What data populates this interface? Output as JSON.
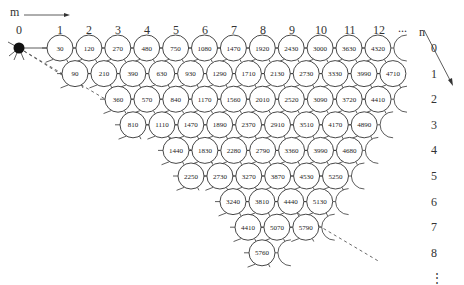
{
  "axes": {
    "m_label": "m",
    "n_label": "n",
    "column_labels": [
      "0",
      "1",
      "2",
      "3",
      "4",
      "5",
      "6",
      "7",
      "8",
      "9",
      "10",
      "11",
      "12",
      "..."
    ],
    "row_labels": [
      "0",
      "1",
      "2",
      "3",
      "4",
      "5",
      "6",
      "7",
      "8",
      "⋮"
    ]
  },
  "start_node": {
    "label": "0",
    "fill": "#111111"
  },
  "rows": [
    {
      "n": 0,
      "start_col": 1,
      "values": [
        30,
        120,
        270,
        480,
        750,
        1080,
        1470,
        1920,
        2430,
        3000,
        3630,
        4320
      ]
    },
    {
      "n": 1,
      "start_col": 1,
      "values": [
        90,
        210,
        390,
        630,
        930,
        1290,
        1710,
        2130,
        2730,
        3330,
        3990,
        4710
      ]
    },
    {
      "n": 2,
      "start_col": 3,
      "values": [
        360,
        570,
        840,
        1170,
        1560,
        2010,
        2520,
        3090,
        3720,
        4410
      ]
    },
    {
      "n": 3,
      "start_col": 4,
      "values": [
        810,
        1110,
        1470,
        1890,
        2370,
        2910,
        3510,
        4170,
        4890
      ]
    },
    {
      "n": 4,
      "start_col": 6,
      "values": [
        1440,
        1830,
        2280,
        2790,
        3360,
        3990,
        4680
      ]
    },
    {
      "n": 5,
      "start_col": 7,
      "values": [
        2250,
        2730,
        3270,
        3870,
        4530,
        5250
      ]
    },
    {
      "n": 6,
      "start_col": 9,
      "values": [
        3240,
        3810,
        4440,
        5130
      ]
    },
    {
      "n": 7,
      "start_col": 10,
      "values": [
        4410,
        5070,
        5790
      ]
    },
    {
      "n": 8,
      "start_col": 12,
      "values": [
        5760
      ]
    }
  ],
  "colors": {
    "stroke": "#333333",
    "node_fill": "#ffffff",
    "dashed": "#444444"
  }
}
